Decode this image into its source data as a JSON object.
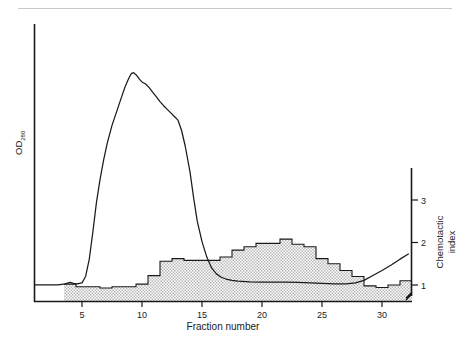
{
  "figure": {
    "background_color": "#ffffff",
    "line_color": "#1a1a1a",
    "fill_color": "#d8d8d8",
    "rule_color": "#c9c9c9"
  },
  "axes": {
    "left": {
      "label_main": "OD",
      "label_sub": "280"
    },
    "bottom": {
      "label": "Fraction number",
      "ticks": [
        "5",
        "10",
        "15",
        "20",
        "25",
        "30"
      ],
      "tick_values": [
        5,
        10,
        15,
        20,
        25,
        30
      ]
    },
    "right": {
      "label_line1": "Chemotactic",
      "label_line2": "index",
      "ticks": [
        "1",
        "2",
        "3"
      ],
      "tick_values": [
        1,
        2,
        3
      ],
      "has_axis_break": true
    }
  },
  "chart_data": {
    "type": "line",
    "title": "",
    "xlabel": "Fraction number",
    "ylabel": "OD280",
    "y2label": "Chemotactic index",
    "xlim": [
      1,
      32.5
    ],
    "ylim": [
      0,
      1.08
    ],
    "y2lim": [
      0.42,
      3.35
    ],
    "grid": false,
    "legend_position": "none",
    "series": [
      {
        "name": "OD280",
        "type": "line",
        "axis": "left",
        "x": [
          1.0,
          2.0,
          3.0,
          3.6,
          4.0,
          4.3,
          4.6,
          5.0,
          5.3,
          5.6,
          5.9,
          6.2,
          6.5,
          6.8,
          7.1,
          7.5,
          7.9,
          8.3,
          8.6,
          8.9,
          9.1,
          9.3,
          9.5,
          9.8,
          10.0,
          10.3,
          10.6,
          10.9,
          11.2,
          11.5,
          11.8,
          12.1,
          12.4,
          12.7,
          13.0,
          13.3,
          13.6,
          14.0,
          14.3,
          14.6,
          15.0,
          15.4,
          15.8,
          16.2,
          16.6,
          17.0,
          17.5,
          18.0,
          19.0,
          20.0,
          21.0,
          22.0,
          23.0,
          24.0,
          25.0,
          26.0,
          27.0,
          27.8,
          28.5,
          29.2,
          30.0,
          30.8,
          31.5,
          32.2
        ],
        "y": [
          0.062,
          0.062,
          0.062,
          0.066,
          0.072,
          0.068,
          0.066,
          0.07,
          0.095,
          0.16,
          0.265,
          0.38,
          0.47,
          0.545,
          0.61,
          0.68,
          0.735,
          0.79,
          0.83,
          0.862,
          0.88,
          0.884,
          0.876,
          0.858,
          0.848,
          0.84,
          0.826,
          0.808,
          0.79,
          0.772,
          0.756,
          0.742,
          0.728,
          0.714,
          0.7,
          0.66,
          0.6,
          0.5,
          0.4,
          0.31,
          0.23,
          0.17,
          0.128,
          0.105,
          0.092,
          0.085,
          0.08,
          0.077,
          0.074,
          0.073,
          0.073,
          0.073,
          0.072,
          0.07,
          0.068,
          0.066,
          0.066,
          0.07,
          0.08,
          0.098,
          0.118,
          0.14,
          0.162,
          0.182
        ]
      },
      {
        "name": "Chemotactic index",
        "type": "step-histogram",
        "axis": "right",
        "bin_start": 4,
        "bin_width": 1,
        "x": [
          4,
          5,
          6,
          7,
          8,
          9,
          10,
          11,
          12,
          13,
          14,
          15,
          16,
          17,
          18,
          19,
          20,
          21,
          22,
          23,
          24,
          25,
          26,
          27,
          28,
          29,
          30,
          31,
          32
        ],
        "y": [
          1.02,
          0.96,
          0.96,
          0.93,
          0.96,
          0.96,
          1.02,
          1.22,
          1.56,
          1.62,
          1.58,
          1.58,
          1.58,
          1.66,
          1.82,
          1.9,
          1.98,
          1.98,
          2.08,
          1.96,
          1.9,
          1.62,
          1.5,
          1.34,
          1.2,
          0.98,
          0.94,
          1.0,
          1.1
        ]
      }
    ]
  }
}
